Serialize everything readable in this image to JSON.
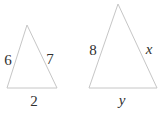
{
  "diagram": {
    "background_color": "#ffffff",
    "line_color": "#c6c6c6",
    "text_color": "#303030",
    "small_triangle": {
      "left_side_label": "6",
      "right_side_label": "7",
      "base_label": "2"
    },
    "large_triangle": {
      "left_side_label": "8",
      "right_side_label": "x",
      "base_label": "y"
    }
  }
}
